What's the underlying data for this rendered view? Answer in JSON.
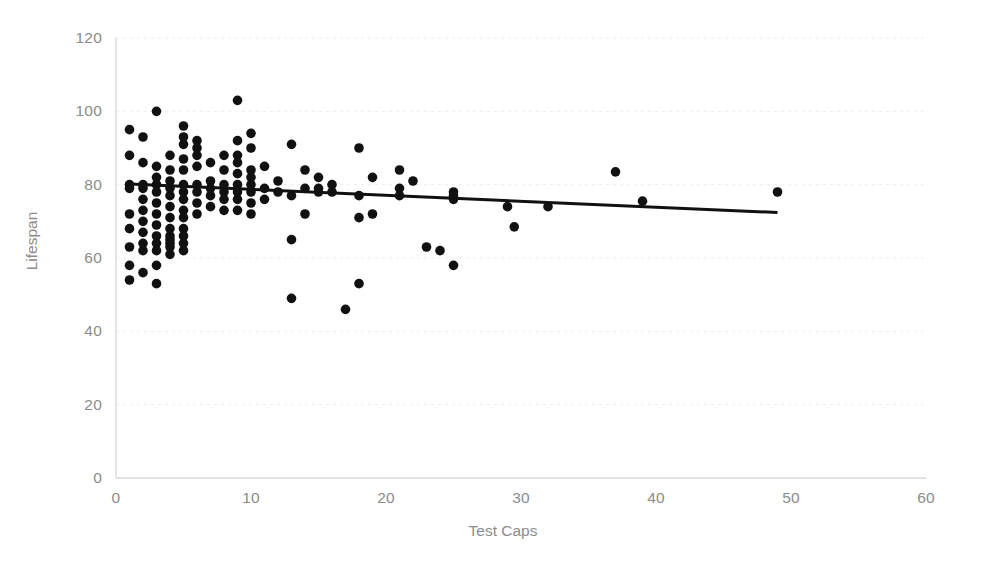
{
  "chart_data": {
    "type": "scatter",
    "title": "",
    "xlabel": "Test Caps",
    "ylabel": "Lifespan",
    "xlim": [
      0,
      60
    ],
    "ylim": [
      0,
      120
    ],
    "xticks": [
      0,
      10,
      20,
      30,
      40,
      50,
      60
    ],
    "yticks": [
      0,
      20,
      40,
      60,
      80,
      100,
      120
    ],
    "grid": "horizontal",
    "legend": "none",
    "marker_color": "#111111",
    "marker_size": 7,
    "axis_color": "#d9d9d9",
    "grid_color": "#ededed",
    "tick_label_color": "#8c8c8c",
    "series": [
      {
        "name": "Players",
        "points": [
          [
            1,
            95
          ],
          [
            1,
            88
          ],
          [
            1,
            80
          ],
          [
            1,
            79
          ],
          [
            1,
            72
          ],
          [
            1,
            68
          ],
          [
            1,
            63
          ],
          [
            1,
            58
          ],
          [
            1,
            54
          ],
          [
            2,
            93
          ],
          [
            2,
            86
          ],
          [
            2,
            80
          ],
          [
            2,
            79
          ],
          [
            2,
            76
          ],
          [
            2,
            73
          ],
          [
            2,
            70
          ],
          [
            2,
            67
          ],
          [
            2,
            64
          ],
          [
            2,
            62
          ],
          [
            2,
            56
          ],
          [
            3,
            100
          ],
          [
            3,
            85
          ],
          [
            3,
            82
          ],
          [
            3,
            80
          ],
          [
            3,
            78
          ],
          [
            3,
            75
          ],
          [
            3,
            72
          ],
          [
            3,
            69
          ],
          [
            3,
            66
          ],
          [
            3,
            64
          ],
          [
            3,
            62
          ],
          [
            3,
            58
          ],
          [
            3,
            53
          ],
          [
            4,
            88
          ],
          [
            4,
            84
          ],
          [
            4,
            81
          ],
          [
            4,
            79
          ],
          [
            4,
            77
          ],
          [
            4,
            74
          ],
          [
            4,
            71
          ],
          [
            4,
            68
          ],
          [
            4,
            66
          ],
          [
            4,
            65
          ],
          [
            4,
            64
          ],
          [
            4,
            63
          ],
          [
            4,
            61
          ],
          [
            5,
            96
          ],
          [
            5,
            93
          ],
          [
            5,
            91
          ],
          [
            5,
            87
          ],
          [
            5,
            84
          ],
          [
            5,
            80
          ],
          [
            5,
            78
          ],
          [
            5,
            76
          ],
          [
            5,
            73
          ],
          [
            5,
            71
          ],
          [
            5,
            68
          ],
          [
            5,
            66
          ],
          [
            5,
            64
          ],
          [
            5,
            62
          ],
          [
            6,
            92
          ],
          [
            6,
            90
          ],
          [
            6,
            88
          ],
          [
            6,
            85
          ],
          [
            6,
            80
          ],
          [
            6,
            78
          ],
          [
            6,
            75
          ],
          [
            6,
            72
          ],
          [
            7,
            86
          ],
          [
            7,
            81
          ],
          [
            7,
            79
          ],
          [
            7,
            77
          ],
          [
            7,
            74
          ],
          [
            8,
            88
          ],
          [
            8,
            84
          ],
          [
            8,
            80
          ],
          [
            8,
            78
          ],
          [
            8,
            76
          ],
          [
            8,
            73
          ],
          [
            9,
            103
          ],
          [
            9,
            92
          ],
          [
            9,
            88
          ],
          [
            9,
            86
          ],
          [
            9,
            83
          ],
          [
            9,
            80
          ],
          [
            9,
            78
          ],
          [
            9,
            76
          ],
          [
            9,
            73
          ],
          [
            10,
            94
          ],
          [
            10,
            90
          ],
          [
            10,
            84
          ],
          [
            10,
            82
          ],
          [
            10,
            80
          ],
          [
            10,
            78
          ],
          [
            10,
            75
          ],
          [
            10,
            72
          ],
          [
            11,
            85
          ],
          [
            11,
            79
          ],
          [
            11,
            76
          ],
          [
            12,
            81
          ],
          [
            12,
            78
          ],
          [
            13,
            91
          ],
          [
            13,
            77
          ],
          [
            13,
            65
          ],
          [
            13,
            49
          ],
          [
            14,
            84
          ],
          [
            14,
            79
          ],
          [
            14,
            72
          ],
          [
            15,
            82
          ],
          [
            15,
            79
          ],
          [
            15,
            78
          ],
          [
            16,
            80
          ],
          [
            16,
            78
          ],
          [
            17,
            46
          ],
          [
            18,
            90
          ],
          [
            18,
            77
          ],
          [
            18,
            71
          ],
          [
            18,
            53
          ],
          [
            19,
            82
          ],
          [
            19,
            72
          ],
          [
            21,
            84
          ],
          [
            21,
            79
          ],
          [
            21,
            77
          ],
          [
            22,
            81
          ],
          [
            23,
            63
          ],
          [
            24,
            62
          ],
          [
            25,
            78
          ],
          [
            25,
            77
          ],
          [
            25,
            76
          ],
          [
            25,
            58
          ],
          [
            29,
            74
          ],
          [
            29.5,
            68.5
          ],
          [
            32,
            74
          ],
          [
            37,
            83.5
          ],
          [
            39,
            75.5
          ],
          [
            49,
            78
          ]
        ]
      }
    ],
    "trendline": {
      "type": "linear",
      "x_start": 1,
      "y_start": 80.2,
      "x_end": 49,
      "y_end": 72.4,
      "color": "#111111",
      "width": 3
    }
  }
}
